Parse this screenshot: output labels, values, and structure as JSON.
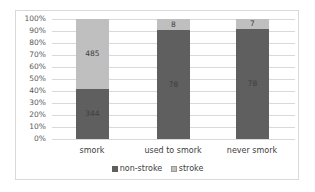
{
  "chart_data": {
    "type": "bar",
    "stacked": true,
    "percent_stacked": true,
    "title": "",
    "xlabel": "",
    "ylabel": "",
    "categories": [
      "smork",
      "used to smork",
      "never smork"
    ],
    "series": [
      {
        "name": "non-stroke",
        "values": [
          344,
          78,
          78
        ],
        "color": "#5f5f5f"
      },
      {
        "name": "stroke",
        "values": [
          485,
          8,
          7
        ],
        "color": "#bfbfbf"
      }
    ],
    "ylim": [
      0,
      100
    ],
    "y_ticks": [
      "0%",
      "10%",
      "20%",
      "30%",
      "40%",
      "50%",
      "60%",
      "70%",
      "80%",
      "90%",
      "100%"
    ],
    "grid": true,
    "legend_position": "bottom"
  },
  "labels": {
    "bars": [
      {
        "category": "smork",
        "non_stroke": "344",
        "stroke": "485"
      },
      {
        "category": "used to smork",
        "non_stroke": "78",
        "stroke": "8"
      },
      {
        "category": "never smork",
        "non_stroke": "78",
        "stroke": "7"
      }
    ],
    "legend": [
      "non-stroke",
      "stroke"
    ]
  }
}
